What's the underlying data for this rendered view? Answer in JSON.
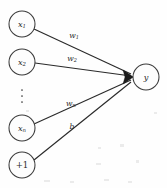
{
  "figure": {
    "background_color": "#fefefe",
    "line_color": "#2a2a2a",
    "node_stroke_color": "#3b3b3b",
    "width": 167,
    "height": 188
  },
  "input_nodes": [
    {
      "id": "x1",
      "base": "x",
      "sub": "1",
      "label": "x1",
      "cx": 22,
      "cy": 24,
      "r": 13
    },
    {
      "id": "x2",
      "base": "x",
      "sub": "2",
      "label": "x2",
      "cx": 22,
      "cy": 62,
      "r": 13
    },
    {
      "id": "xn",
      "base": "x",
      "sub": "n",
      "label": "xn",
      "cx": 22,
      "cy": 128,
      "r": 13
    },
    {
      "id": "bias",
      "base": "+1",
      "sub": "",
      "label": "+1",
      "cx": 22,
      "cy": 165,
      "r": 13
    }
  ],
  "ellipsis": {
    "name": "vertical-ellipsis",
    "glyph": "⋮",
    "cx": 22,
    "dots_y": [
      90,
      96,
      102
    ]
  },
  "output_node": {
    "id": "y",
    "base": "y",
    "sub": "",
    "label": "y",
    "cx": 146,
    "cy": 77,
    "r": 13
  },
  "edges": [
    {
      "id": "edge-x1-y",
      "from": "x1",
      "to": "y",
      "label_base": "w",
      "label_sub": "1",
      "label": "w1",
      "label_x": 74,
      "label_y": 35,
      "x1": 34,
      "y1": 29,
      "x2": 131,
      "y2": 74
    },
    {
      "id": "edge-x2-y",
      "from": "x2",
      "to": "y",
      "label_base": "w",
      "label_sub": "2",
      "label": "w2",
      "label_x": 72,
      "label_y": 58,
      "x1": 35,
      "y1": 63,
      "x2": 131,
      "y2": 76
    },
    {
      "id": "edge-xn-y",
      "from": "xn",
      "to": "y",
      "label_base": "w",
      "label_sub": "n",
      "label": "wn",
      "label_x": 71,
      "label_y": 103,
      "x1": 34,
      "y1": 124,
      "x2": 131,
      "y2": 80
    },
    {
      "id": "edge-bias-y",
      "from": "bias",
      "to": "y",
      "label_base": "b",
      "label_sub": "",
      "label": "b",
      "label_x": 72,
      "label_y": 126,
      "x1": 34,
      "y1": 160,
      "x2": 131,
      "y2": 82
    }
  ],
  "arrow_head": {
    "name": "arrow-head",
    "tip_x": 133,
    "tip_y": 77
  },
  "scan_specks": [
    {
      "x": 98,
      "y": 147,
      "w": 3,
      "h": 2
    },
    {
      "x": 120,
      "y": 144,
      "w": 4,
      "h": 3
    },
    {
      "x": 96,
      "y": 163,
      "w": 5,
      "h": 2
    },
    {
      "x": 136,
      "y": 160,
      "w": 3,
      "h": 3
    },
    {
      "x": 44,
      "y": 180,
      "w": 6,
      "h": 2
    },
    {
      "x": 70,
      "y": 181,
      "w": 4,
      "h": 2
    },
    {
      "x": 104,
      "y": 179,
      "w": 5,
      "h": 2
    },
    {
      "x": 128,
      "y": 181,
      "w": 4,
      "h": 2
    },
    {
      "x": 26,
      "y": 110,
      "w": 3,
      "h": 2
    },
    {
      "x": 154,
      "y": 112,
      "w": 3,
      "h": 2
    }
  ]
}
